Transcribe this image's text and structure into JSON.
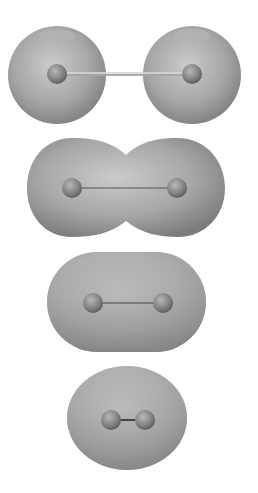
{
  "figure": {
    "colors": {
      "background": "#ffffff",
      "surface_light": "#c9c9c9",
      "surface_mid": "#a4a4a4",
      "surface_dark": "#7a7a7a",
      "nucleus_light": "#b5b5b5",
      "nucleus_dark": "#5e5e5e",
      "bond": "#555555"
    },
    "stages": [
      {
        "id": "separated-atoms",
        "nuclei": [
          [
            57,
            74
          ],
          [
            192,
            74
          ]
        ]
      },
      {
        "id": "overlapping-atoms",
        "nuclei": [
          [
            72,
            188
          ],
          [
            177,
            188
          ]
        ]
      },
      {
        "id": "merged-capsule",
        "nuclei": [
          [
            93,
            303
          ],
          [
            163,
            303
          ]
        ]
      },
      {
        "id": "bonded-molecule",
        "nuclei": [
          [
            111,
            420
          ],
          [
            145,
            420
          ]
        ]
      }
    ]
  }
}
